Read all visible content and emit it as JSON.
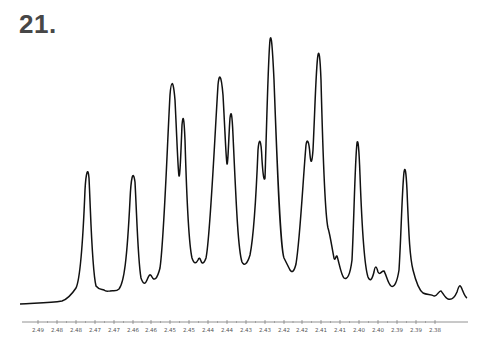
{
  "figure": {
    "label": "21."
  },
  "chart_data": {
    "type": "line",
    "title": "21.",
    "xlabel": "",
    "ylabel": "",
    "x_reversed": true,
    "grid": false,
    "legend": null,
    "xlim": [
      2.495,
      2.375
    ],
    "x_tick_labels": [
      "2.49",
      "2.48",
      "2.48",
      "2.47",
      "2.47",
      "2.46",
      "2.46",
      "2.45",
      "2.45",
      "2.44",
      "2.44",
      "2.43",
      "2.43",
      "2.42",
      "2.42",
      "2.41",
      "2.41",
      "2.40",
      "2.40",
      "2.39",
      "2.39",
      "2.38"
    ],
    "series": [
      {
        "name": "spectrum",
        "description": "1H NMR multiplet region, relative intensity (0 = baseline, 100 = tallest peak)",
        "peaks": [
          {
            "x_ppm": 2.481,
            "intensity": 51
          },
          {
            "x_ppm": 2.472,
            "intensity": 49
          },
          {
            "x_ppm": 2.464,
            "intensity": 6
          },
          {
            "x_ppm": 2.459,
            "intensity": 84
          },
          {
            "x_ppm": 2.457,
            "intensity": 68
          },
          {
            "x_ppm": 2.45,
            "intensity": 16
          },
          {
            "x_ppm": 2.446,
            "intensity": 86
          },
          {
            "x_ppm": 2.444,
            "intensity": 71
          },
          {
            "x_ppm": 2.435,
            "intensity": 62
          },
          {
            "x_ppm": 2.433,
            "intensity": 100
          },
          {
            "x_ppm": 2.424,
            "intensity": 62
          },
          {
            "x_ppm": 2.422,
            "intensity": 94
          },
          {
            "x_ppm": 2.416,
            "intensity": 17
          },
          {
            "x_ppm": 2.413,
            "intensity": 5
          },
          {
            "x_ppm": 2.41,
            "intensity": 61
          },
          {
            "x_ppm": 2.404,
            "intensity": 13
          },
          {
            "x_ppm": 2.402,
            "intensity": 11
          },
          {
            "x_ppm": 2.398,
            "intensity": 52
          },
          {
            "x_ppm": 2.387,
            "intensity": 4
          },
          {
            "x_ppm": 2.378,
            "intensity": 7
          }
        ]
      }
    ]
  },
  "axis": {
    "ticks": [
      {
        "label": "2.49",
        "x": 38
      },
      {
        "label": "2.48",
        "x": 57
      },
      {
        "label": "2.48",
        "x": 76
      },
      {
        "label": "2.47",
        "x": 95
      },
      {
        "label": "2.47",
        "x": 114
      },
      {
        "label": "2.46",
        "x": 133
      },
      {
        "label": "2.46",
        "x": 151
      },
      {
        "label": "2.45",
        "x": 170
      },
      {
        "label": "2.45",
        "x": 189
      },
      {
        "label": "2.44",
        "x": 208
      },
      {
        "label": "2.44",
        "x": 227
      },
      {
        "label": "2.43",
        "x": 246
      },
      {
        "label": "2.43",
        "x": 265
      },
      {
        "label": "2.42",
        "x": 284
      },
      {
        "label": "2.42",
        "x": 302
      },
      {
        "label": "2.41",
        "x": 321
      },
      {
        "label": "2.41",
        "x": 340
      },
      {
        "label": "2.40",
        "x": 359
      },
      {
        "label": "2.40",
        "x": 378
      },
      {
        "label": "2.39",
        "x": 397
      },
      {
        "label": "2.39",
        "x": 416
      },
      {
        "label": "2.38",
        "x": 435
      }
    ]
  },
  "colors": {
    "trace": "#111111",
    "axis": "#777777",
    "title": "#474747",
    "background": "#ffffff"
  }
}
